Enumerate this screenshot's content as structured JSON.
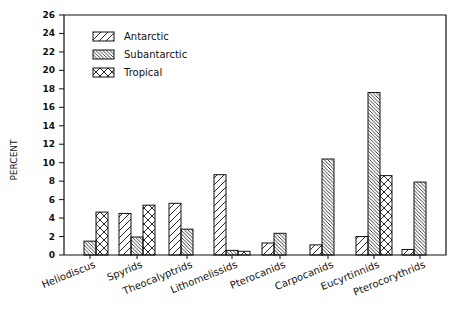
{
  "chart_data": {
    "type": "bar",
    "title": "",
    "xlabel": "",
    "ylabel": "PERCENT",
    "ylim": [
      0,
      26
    ],
    "yticks": [
      0,
      2,
      4,
      6,
      8,
      10,
      12,
      14,
      16,
      18,
      20,
      22,
      24,
      26
    ],
    "grid": false,
    "legend_position": "upper left",
    "categories": [
      "Heliodiscus",
      "Spyrids",
      "Theocalyptrids",
      "Lithomelissids",
      "Pterocanids",
      "Carpocanids",
      "Eucyrtinnids",
      "Pterocorythrids"
    ],
    "series": [
      {
        "name": "Antarctic",
        "pattern": "forward-diagonal-hatch",
        "values": [
          0,
          4.5,
          5.6,
          8.7,
          1.3,
          1.1,
          2.0,
          0.6
        ]
      },
      {
        "name": "Subantarctic",
        "pattern": "back-diagonal-hatch",
        "values": [
          1.5,
          1.95,
          2.8,
          0.5,
          2.35,
          10.4,
          17.6,
          7.9
        ]
      },
      {
        "name": "Tropical",
        "pattern": "cross-hatch",
        "values": [
          4.65,
          5.4,
          0,
          0.4,
          0,
          0,
          8.6,
          0
        ]
      }
    ]
  }
}
